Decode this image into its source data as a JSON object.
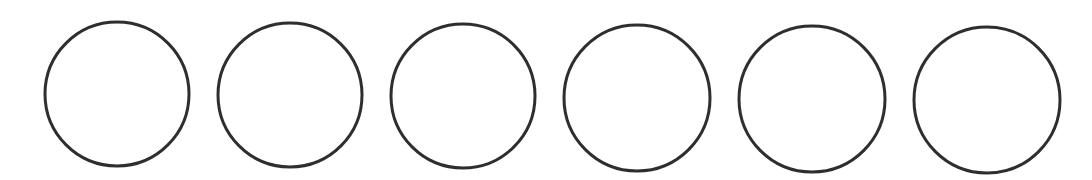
{
  "canvas": {
    "width": 1092,
    "height": 180,
    "background": "#ffffff"
  },
  "style": {
    "stroke": "#2e2e2e",
    "stroke_width": 3,
    "fill": "#ffffff"
  },
  "circles": [
    {
      "cx": 117,
      "cy": 94,
      "r": 72
    },
    {
      "cx": 290,
      "cy": 95,
      "r": 72
    },
    {
      "cx": 463,
      "cy": 96,
      "r": 72
    },
    {
      "cx": 637,
      "cy": 98,
      "r": 73
    },
    {
      "cx": 812,
      "cy": 99,
      "r": 73
    },
    {
      "cx": 987,
      "cy": 100,
      "r": 73
    }
  ]
}
